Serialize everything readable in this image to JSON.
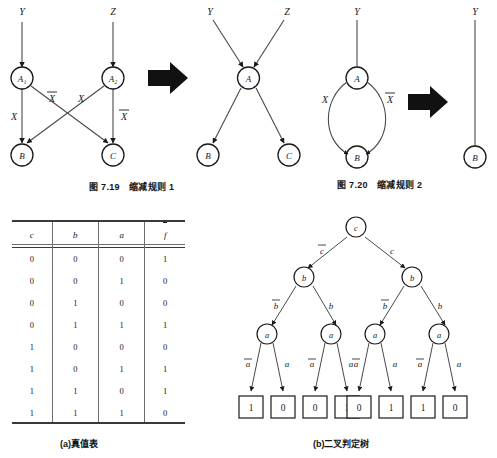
{
  "figure_top": {
    "left_diagram": {
      "name": "reduction-rule-1-before",
      "inputs": [
        {
          "label": "Y"
        },
        {
          "label": "Z"
        }
      ],
      "nodes": [
        {
          "id": "A1",
          "label": "A₁"
        },
        {
          "id": "A2",
          "label": "A₂"
        },
        {
          "id": "B",
          "label": "B"
        },
        {
          "id": "C",
          "label": "C"
        }
      ],
      "edge_labels": [
        {
          "text": "X",
          "kind": "plain",
          "pos": "A1-B"
        },
        {
          "text": "X",
          "kind": "overline",
          "pos": "A1-C"
        },
        {
          "text": "X",
          "kind": "plain",
          "pos": "A2-B"
        },
        {
          "text": "X",
          "kind": "overline",
          "pos": "A2-C"
        }
      ]
    },
    "arrow": {
      "name": "transform-arrow",
      "glyph": "➡"
    },
    "right_diagram": {
      "name": "reduction-rule-1-after",
      "inputs": [
        {
          "label": "Y"
        },
        {
          "label": "Z"
        }
      ],
      "nodes": [
        {
          "id": "A",
          "label": "A"
        },
        {
          "id": "B",
          "label": "B"
        },
        {
          "id": "C",
          "label": "C"
        }
      ]
    },
    "caption": "图 7.19 缩减规则 1"
  },
  "figure_top_right": {
    "left_diagram": {
      "name": "reduction-rule-2-before",
      "inputs": [
        {
          "label": "Y"
        }
      ],
      "nodes": [
        {
          "id": "A",
          "label": "A"
        },
        {
          "id": "B",
          "label": "B"
        }
      ],
      "edge_labels": [
        {
          "text": "X",
          "kind": "plain",
          "pos": "left"
        },
        {
          "text": "X",
          "kind": "overline",
          "pos": "right"
        }
      ]
    },
    "arrow": {
      "name": "transform-arrow",
      "glyph": "➡"
    },
    "right_diagram": {
      "name": "reduction-rule-2-after",
      "inputs": [
        {
          "label": "Y"
        }
      ],
      "nodes": [
        {
          "id": "B",
          "label": "B"
        }
      ]
    },
    "caption": "图 7.20 缩减规则 2"
  },
  "truth_table": {
    "headers": [
      "c",
      "b",
      "a",
      "f"
    ],
    "header_overline_index": 3,
    "rows": [
      [
        "0",
        "0",
        "0",
        "1"
      ],
      [
        "0",
        "0",
        "1",
        "0"
      ],
      [
        "0",
        "1",
        "0",
        "0"
      ],
      [
        "0",
        "1",
        "1",
        "1"
      ],
      [
        "1",
        "0",
        "0",
        "0"
      ],
      [
        "1",
        "0",
        "1",
        "1"
      ],
      [
        "1",
        "1",
        "0",
        "1"
      ],
      [
        "1",
        "1",
        "1",
        "0"
      ]
    ],
    "caption": "(a)真值表"
  },
  "decision_tree": {
    "root": {
      "label": "c"
    },
    "level2": [
      {
        "label": "b"
      },
      {
        "label": "b"
      }
    ],
    "level3": [
      {
        "label": "a"
      },
      {
        "label": "a"
      },
      {
        "label": "a"
      },
      {
        "label": "a"
      }
    ],
    "leaves": [
      "1",
      "0",
      "0",
      "1",
      "0",
      "1",
      "1",
      "0"
    ],
    "edge_labels_level1": [
      {
        "text": "c",
        "kind": "overline"
      },
      {
        "text": "c",
        "kind": "plain"
      }
    ],
    "edge_labels_level2": [
      {
        "text": "b",
        "kind": "overline"
      },
      {
        "text": "b",
        "kind": "plain"
      },
      {
        "text": "b",
        "kind": "overline"
      },
      {
        "text": "b",
        "kind": "plain"
      }
    ],
    "edge_labels_level3": [
      {
        "text": "a",
        "kind": "overline"
      },
      {
        "text": "a",
        "kind": "plain"
      },
      {
        "text": "a",
        "kind": "overline"
      },
      {
        "text": "a",
        "kind": "plain"
      },
      {
        "text": "a",
        "kind": "overline"
      },
      {
        "text": "a",
        "kind": "plain"
      },
      {
        "text": "a",
        "kind": "overline"
      },
      {
        "text": "a",
        "kind": "plain"
      }
    ],
    "caption": "(b)二叉判定树"
  },
  "colors": {
    "ink": "#1a1a1a",
    "line": "#4a4a4a",
    "rule": "#6e6e6e",
    "arrow_fill": "#111111"
  }
}
